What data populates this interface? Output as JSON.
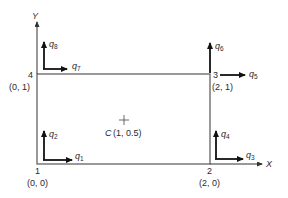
{
  "diagram": {
    "type": "rectangular-element-dof",
    "axes": {
      "x_label": "X",
      "y_label": "Y"
    },
    "centroid": {
      "symbol": "C",
      "coords": "(1, 0.5)"
    },
    "nodes": [
      {
        "id": "1",
        "coords": "(0, 0)"
      },
      {
        "id": "2",
        "coords": "(2, 0)"
      },
      {
        "id": "3",
        "coords": "(2, 1)"
      },
      {
        "id": "4",
        "coords": "(0, 1)"
      }
    ],
    "dofs": [
      {
        "base": "q",
        "sub": "1",
        "node": "1",
        "direction": "x"
      },
      {
        "base": "q",
        "sub": "2",
        "node": "1",
        "direction": "y"
      },
      {
        "base": "q",
        "sub": "3",
        "node": "2",
        "direction": "x"
      },
      {
        "base": "q",
        "sub": "4",
        "node": "2",
        "direction": "y"
      },
      {
        "base": "q",
        "sub": "5",
        "node": "3",
        "direction": "x"
      },
      {
        "base": "q",
        "sub": "6",
        "node": "3",
        "direction": "y"
      },
      {
        "base": "q",
        "sub": "7",
        "node": "4",
        "direction": "x"
      },
      {
        "base": "q",
        "sub": "8",
        "node": "4",
        "direction": "y"
      }
    ],
    "colors": {
      "line": "#555555",
      "arrow": "#111111",
      "text": "#2a2a2a"
    }
  }
}
